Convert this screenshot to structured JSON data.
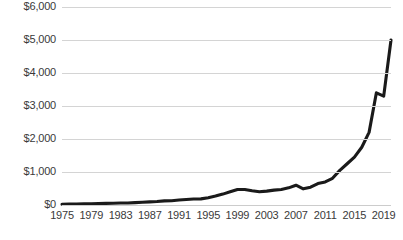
{
  "chart_data": {
    "type": "line",
    "title": "",
    "subtitle": "",
    "xlabel": "",
    "ylabel": "",
    "xlim": [
      1975,
      2020
    ],
    "ylim": [
      0,
      6000
    ],
    "grid": true,
    "legend": false,
    "legend_position": "none",
    "y_tick_labels": [
      "$6,000",
      "$5,000",
      "$4,000",
      "$3,000",
      "$2,000",
      "$1,000",
      "$0"
    ],
    "y_tick_values": [
      6000,
      5000,
      4000,
      3000,
      2000,
      1000,
      0
    ],
    "x_tick_labels": [
      "1975",
      "1979",
      "1983",
      "1987",
      "1991",
      "1995",
      "1999",
      "2003",
      "2007",
      "2011",
      "2015",
      "2019"
    ],
    "x_tick_values": [
      1975,
      1979,
      1983,
      1987,
      1991,
      1995,
      1999,
      2003,
      2007,
      2011,
      2015,
      2019
    ],
    "line_color": "#1a1a1a",
    "grid_color": "#d4d4d4",
    "series": [
      {
        "name": "Index value",
        "x": [
          1975,
          1976,
          1977,
          1978,
          1979,
          1980,
          1981,
          1982,
          1983,
          1984,
          1985,
          1986,
          1987,
          1988,
          1989,
          1990,
          1991,
          1992,
          1993,
          1994,
          1995,
          1996,
          1997,
          1998,
          1999,
          2000,
          2001,
          2002,
          2003,
          2004,
          2005,
          2006,
          2007,
          2008,
          2009,
          2010,
          2011,
          2012,
          2013,
          2014,
          2015,
          2016,
          2017,
          2018,
          2019,
          2020
        ],
        "values": [
          25,
          28,
          30,
          33,
          38,
          45,
          48,
          52,
          60,
          62,
          72,
          85,
          95,
          105,
          125,
          130,
          150,
          165,
          180,
          185,
          220,
          270,
          330,
          400,
          470,
          470,
          430,
          400,
          420,
          450,
          470,
          520,
          600,
          490,
          540,
          650,
          700,
          810,
          1050,
          1250,
          1450,
          1750,
          2200,
          3400,
          3300,
          5000
        ]
      }
    ]
  }
}
